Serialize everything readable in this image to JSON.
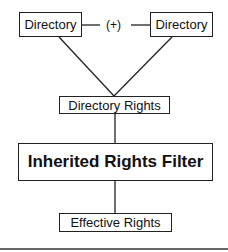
{
  "diagram": {
    "nodes": {
      "dir_left": {
        "label": "Directory"
      },
      "dir_right": {
        "label": "Directory"
      },
      "dir_rights": {
        "label": "Directory Rights"
      },
      "irf": {
        "label": "Inherited Rights Filter"
      },
      "effective": {
        "label": "Effective Rights"
      }
    },
    "connector_label": "(+)",
    "edges": [
      {
        "from": "dir_left",
        "to": "dir_right",
        "label": "(+)"
      },
      {
        "from": "dir_left",
        "to": "dir_rights"
      },
      {
        "from": "dir_right",
        "to": "dir_rights"
      },
      {
        "from": "dir_rights",
        "to": "irf"
      },
      {
        "from": "irf",
        "to": "effective"
      }
    ]
  }
}
